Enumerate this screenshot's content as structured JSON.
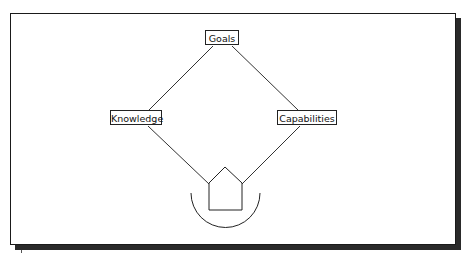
{
  "diagram": {
    "nodes": {
      "goals": {
        "label": "Goals"
      },
      "knowledge": {
        "label": "Knowledge"
      },
      "capabilities": {
        "label": "Capabilities"
      }
    },
    "center_icon": "house-icon",
    "base_icon": "cradle-arc",
    "edges": [
      {
        "from": "Goals",
        "to": "Knowledge"
      },
      {
        "from": "Goals",
        "to": "Capabilities"
      },
      {
        "from": "Knowledge",
        "to": "House"
      },
      {
        "from": "Capabilities",
        "to": "House"
      }
    ],
    "colors": {
      "line": "#333333",
      "frame": "#1a1a1a",
      "shadow": "#2a2a2a",
      "background": "#ffffff"
    }
  }
}
